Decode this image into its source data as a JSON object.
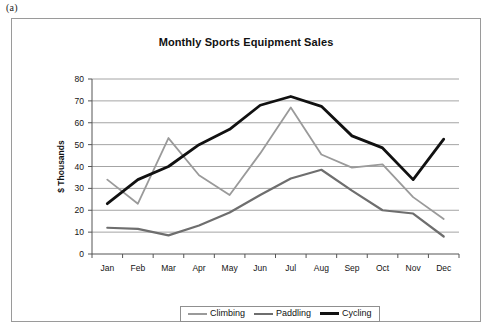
{
  "figure": {
    "label": "(a)"
  },
  "chart_data": {
    "type": "line",
    "title": "Monthly Sports Equipment Sales",
    "xlabel": "",
    "ylabel": "$ Thousands",
    "categories": [
      "Jan",
      "Feb",
      "Mar",
      "Apr",
      "May",
      "Jun",
      "Jul",
      "Aug",
      "Sep",
      "Oct",
      "Nov",
      "Dec"
    ],
    "ylim": [
      0,
      80
    ],
    "yticks": [
      0,
      10,
      20,
      30,
      40,
      50,
      60,
      70,
      80
    ],
    "ytick_labels": [
      "0",
      "10",
      "20",
      "30",
      "40",
      "50",
      "60",
      "70",
      "80"
    ],
    "grid": "horizontal",
    "legend_position": "bottom",
    "series": [
      {
        "name": "Climbing",
        "color": "#9a9a9a",
        "values": [
          34,
          23,
          53,
          36,
          27,
          46,
          67,
          45.5,
          39.5,
          41,
          26,
          16
        ]
      },
      {
        "name": "Paddling",
        "color": "#6e6e6e",
        "values": [
          12,
          11.5,
          8.5,
          13,
          19,
          27,
          34.5,
          38.5,
          29,
          20,
          18.5,
          8
        ]
      },
      {
        "name": "Cycling",
        "color": "#111111",
        "values": [
          23,
          34,
          40,
          50,
          57,
          68,
          72,
          67.5,
          54,
          48.5,
          34,
          52.5
        ]
      }
    ]
  },
  "legend": {
    "items": [
      {
        "label": "Climbing",
        "color": "#9a9a9a",
        "width": 2
      },
      {
        "label": "Paddling",
        "color": "#6e6e6e",
        "width": 2.5
      },
      {
        "label": "Cycling",
        "color": "#111111",
        "width": 3
      }
    ]
  }
}
